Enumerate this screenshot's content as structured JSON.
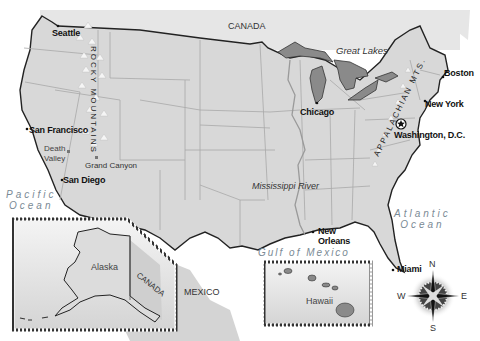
{
  "map": {
    "title": "United States Geography",
    "colors": {
      "land": "#d8d8d8",
      "land_light": "#e4e4e4",
      "lakes": "#8a8a8a",
      "border": "#222222",
      "state_lines": "#a8a8a8",
      "ocean_text": "#7a8a95",
      "inset_border": "#333333"
    },
    "countries": {
      "canada": "CANADA",
      "mexico": "MEXICO",
      "canada_inset": "CANADA"
    },
    "water": {
      "pacific": "Pacific Ocean",
      "pacific_line1": "Pacific",
      "pacific_line2": "Ocean",
      "atlantic_line1": "Atlantic",
      "atlantic_line2": "Ocean",
      "gulf": "Gulf of Mexico",
      "great_lakes": "Great Lakes",
      "mississippi": "Mississippi River"
    },
    "mountains": {
      "rocky": "ROCKY MOUNTAINS",
      "appalachian": "APPALACHIAN MTS."
    },
    "cities": [
      {
        "name": "Seattle"
      },
      {
        "name": "San Francisco"
      },
      {
        "name": "San Diego"
      },
      {
        "name": "Chicago"
      },
      {
        "name": "Boston"
      },
      {
        "name": "New York"
      },
      {
        "name": "Washington, D.C.",
        "capital": true
      },
      {
        "name": "New Orleans"
      },
      {
        "name": "Miami"
      }
    ],
    "landmarks": [
      {
        "name": "Death Valley",
        "line1": "Death",
        "line2": "Valley"
      },
      {
        "name": "Grand Canyon"
      }
    ],
    "insets": {
      "alaska": "Alaska",
      "hawaii": "Hawaii"
    },
    "compass": {
      "north": "N",
      "south": "S",
      "east": "E",
      "west": "W"
    }
  }
}
